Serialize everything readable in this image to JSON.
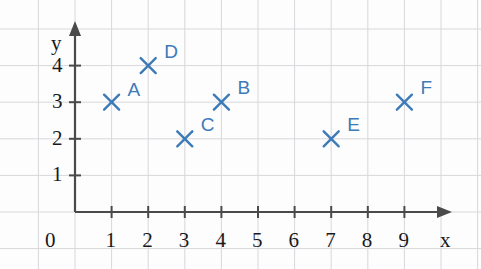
{
  "chart_data": {
    "type": "scatter",
    "title": "",
    "xlabel": "x",
    "ylabel": "y",
    "xlim": [
      0,
      9.8
    ],
    "ylim": [
      0,
      4.9
    ],
    "grid": true,
    "legend": "none",
    "origin_label": "0",
    "xticks": [
      1,
      2,
      3,
      4,
      5,
      6,
      7,
      8,
      9
    ],
    "xtick_labels": [
      "1",
      "2",
      "3",
      "4",
      "5",
      "6",
      "7",
      "8",
      "9"
    ],
    "yticks": [
      1,
      2,
      3,
      4
    ],
    "ytick_labels": [
      "1",
      "2",
      "3",
      "4"
    ],
    "marker": "x",
    "marker_color": "#3d7ab8",
    "axis_color": "#4a4a4a",
    "grid_color": "#d8d8dc",
    "points": [
      {
        "label": "A",
        "x": 1,
        "y": 3,
        "label_dx": 16,
        "label_dy": -22
      },
      {
        "label": "D",
        "x": 2,
        "y": 4,
        "label_dx": 16,
        "label_dy": -24
      },
      {
        "label": "C",
        "x": 3,
        "y": 2,
        "label_dx": 16,
        "label_dy": -24
      },
      {
        "label": "B",
        "x": 4,
        "y": 3,
        "label_dx": 16,
        "label_dy": -24
      },
      {
        "label": "E",
        "x": 7,
        "y": 2,
        "label_dx": 16,
        "label_dy": -24
      },
      {
        "label": "F",
        "x": 9,
        "y": 3,
        "label_dx": 16,
        "label_dy": -24
      }
    ]
  }
}
